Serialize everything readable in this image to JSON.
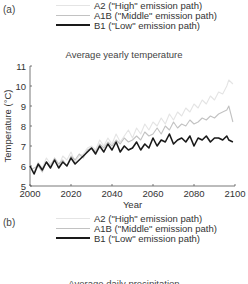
{
  "panel_a": {
    "label": "(a)",
    "legend": [
      {
        "label": "A2 (\"High\" emission path)",
        "color": "#e4e4e4",
        "width": 1
      },
      {
        "label": "A1B (\"Middle\" emission path)",
        "color": "#c2c2c2",
        "width": 1
      },
      {
        "label": "B1 (\"Low\" emission path)",
        "color": "#1a1a1a",
        "width": 2
      }
    ],
    "title": "Average yearly temperature"
  },
  "panel_b": {
    "label": "(b)",
    "legend": [
      {
        "label": "A2 (\"High\" emission path)",
        "color": "#e4e4e4",
        "width": 1
      },
      {
        "label": "A1B (\"Middle\" emission path)",
        "color": "#c2c2c2",
        "width": 1
      },
      {
        "label": "B1 (\"Low\" emission path)",
        "color": "#1a1a1a",
        "width": 2
      }
    ],
    "title": "Average daily precipitation"
  },
  "chart_data": {
    "type": "line",
    "title": "Average yearly temperature",
    "xlabel": "Year",
    "ylabel": "Temperature (°C)",
    "xlim": [
      2000,
      2100
    ],
    "ylim": [
      5,
      11
    ],
    "xticks": [
      2000,
      2020,
      2040,
      2060,
      2080,
      2100
    ],
    "yticks": [
      5,
      6,
      7,
      8,
      9,
      10,
      11
    ],
    "grid": false,
    "legend_position": "top",
    "x": [
      2000,
      2002,
      2004,
      2006,
      2008,
      2010,
      2012,
      2014,
      2016,
      2018,
      2020,
      2022,
      2024,
      2026,
      2028,
      2030,
      2032,
      2034,
      2036,
      2038,
      2040,
      2042,
      2044,
      2046,
      2048,
      2050,
      2052,
      2054,
      2056,
      2058,
      2060,
      2062,
      2064,
      2066,
      2068,
      2070,
      2072,
      2074,
      2076,
      2078,
      2080,
      2082,
      2084,
      2086,
      2088,
      2090,
      2092,
      2094,
      2096,
      2097,
      2099
    ],
    "series": [
      {
        "name": "A2 (\"High\" emission path)",
        "color": "#e4e4e4",
        "values": [
          5.9,
          5.7,
          6.2,
          5.9,
          6.4,
          6.1,
          6.3,
          6.0,
          6.5,
          6.3,
          6.7,
          6.2,
          6.5,
          6.6,
          6.9,
          7.0,
          6.8,
          7.3,
          7.0,
          7.4,
          7.1,
          7.6,
          7.2,
          7.5,
          7.8,
          7.4,
          7.9,
          7.6,
          8.1,
          7.8,
          8.2,
          8.0,
          8.4,
          8.1,
          8.6,
          8.3,
          8.7,
          8.5,
          8.9,
          8.7,
          9.1,
          8.9,
          9.3,
          9.1,
          9.5,
          9.3,
          9.7,
          9.6,
          10.0,
          10.3,
          10.1
        ]
      },
      {
        "name": "A1B (\"Middle\" emission path)",
        "color": "#c2c2c2",
        "values": [
          5.8,
          5.9,
          6.0,
          5.7,
          6.2,
          6.0,
          6.4,
          6.1,
          6.3,
          6.0,
          6.5,
          6.3,
          6.6,
          6.4,
          6.8,
          6.9,
          6.7,
          7.1,
          6.9,
          7.2,
          7.0,
          7.3,
          7.1,
          7.4,
          7.2,
          7.3,
          7.5,
          7.3,
          7.7,
          7.5,
          7.6,
          7.9,
          7.6,
          8.0,
          7.8,
          8.2,
          7.9,
          8.1,
          8.0,
          8.3,
          8.1,
          8.2,
          8.4,
          8.3,
          8.5,
          8.4,
          8.6,
          8.7,
          8.8,
          9.0,
          8.2
        ]
      },
      {
        "name": "B1 (\"Low\" emission path)",
        "color": "#1a1a1a",
        "values": [
          6.0,
          5.6,
          6.1,
          5.8,
          6.2,
          5.9,
          6.3,
          5.9,
          6.2,
          6.0,
          6.4,
          6.1,
          6.3,
          6.5,
          6.7,
          6.9,
          6.6,
          7.0,
          6.7,
          7.1,
          6.8,
          7.2,
          6.7,
          7.0,
          6.8,
          6.9,
          7.2,
          6.8,
          7.1,
          6.9,
          7.4,
          7.0,
          7.3,
          7.2,
          7.6,
          7.1,
          7.3,
          7.4,
          7.2,
          7.5,
          7.0,
          7.4,
          7.3,
          7.5,
          7.2,
          7.4,
          7.4,
          7.3,
          7.5,
          7.3,
          7.2
        ]
      }
    ]
  }
}
